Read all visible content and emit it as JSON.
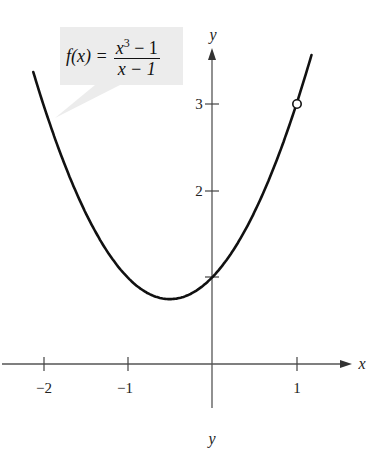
{
  "chart_data": {
    "type": "line",
    "title": "",
    "function_label": {
      "lhs": "f(x) =",
      "numerator_base": "x",
      "numerator_exp": "3",
      "numerator_rest": " − 1",
      "denominator": "x − 1"
    },
    "xlabel": "x",
    "ylabel": "y",
    "bottom_label": "y",
    "x_ticks": [
      -2,
      -1,
      1
    ],
    "x_tick_labels": [
      "−2",
      "−1",
      "1"
    ],
    "y_ticks": [
      1,
      2,
      3
    ],
    "y_tick_labels": [
      "2",
      "3"
    ],
    "xlim": [
      -2.5,
      1.65
    ],
    "ylim": [
      -0.5,
      3.7
    ],
    "grid": false,
    "series": [
      {
        "name": "f(x) = (x^3 - 1)/(x - 1)",
        "equivalent": "x^2 + x + 1, x ≠ 1",
        "x": [
          -2.1,
          -2,
          -1.5,
          -1,
          -0.5,
          0,
          0.5,
          1,
          1.15
        ],
        "y": [
          3.31,
          3,
          1.75,
          1,
          0.75,
          1,
          1.75,
          3,
          3.47
        ]
      }
    ],
    "annotations": [
      {
        "type": "open-circle",
        "x": 1,
        "y": 3,
        "meaning": "hole (undefined at x = 1)"
      }
    ]
  }
}
